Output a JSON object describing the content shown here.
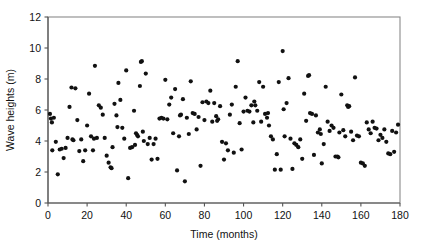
{
  "chart_data": {
    "type": "scatter",
    "title": "",
    "xlabel": "Time (months)",
    "ylabel": "Wave heights (m)",
    "xlim": [
      0,
      180
    ],
    "ylim": [
      0,
      12
    ],
    "xticks": [
      0,
      20,
      40,
      60,
      80,
      100,
      120,
      140,
      160,
      180
    ],
    "yticks": [
      0,
      2,
      4,
      6,
      8,
      10,
      12
    ],
    "xtick_labels": [
      "0",
      "20",
      "40",
      "60",
      "80",
      "100",
      "120",
      "140",
      "160",
      "180"
    ],
    "ytick_labels": [
      "0",
      "2",
      "4",
      "6",
      "8",
      "10",
      "12"
    ],
    "grid": false,
    "legend": null,
    "marker": {
      "shape": "circle",
      "color": "#111111",
      "size": 2.1
    },
    "frame_color": "#8a8a8a",
    "n_points": 186,
    "points": [
      [
        1.0,
        5.75
      ],
      [
        1.5,
        5.45
      ],
      [
        2.0,
        5.2
      ],
      [
        2.2,
        3.4
      ],
      [
        3.0,
        5.5
      ],
      [
        4.0,
        3.95
      ],
      [
        5.0,
        1.85
      ],
      [
        6.0,
        3.45
      ],
      [
        7.0,
        3.5
      ],
      [
        8.0,
        2.9
      ],
      [
        9.0,
        3.55
      ],
      [
        10.0,
        4.2
      ],
      [
        11.0,
        6.2
      ],
      [
        12.0,
        7.45
      ],
      [
        12.5,
        4.1
      ],
      [
        13.0,
        4.05
      ],
      [
        14.0,
        7.4
      ],
      [
        15.0,
        5.35
      ],
      [
        16.0,
        3.35
      ],
      [
        17.0,
        4.1
      ],
      [
        18.0,
        2.7
      ],
      [
        19.0,
        3.4
      ],
      [
        20.0,
        5.0
      ],
      [
        21.0,
        7.05
      ],
      [
        22.0,
        4.3
      ],
      [
        23.0,
        3.4
      ],
      [
        24.0,
        8.85
      ],
      [
        25.0,
        4.2
      ],
      [
        26.0,
        6.3
      ],
      [
        27.0,
        6.15
      ],
      [
        28.0,
        5.7
      ],
      [
        29.0,
        4.2
      ],
      [
        30.0,
        3.05
      ],
      [
        31.0,
        2.6
      ],
      [
        32.0,
        2.3
      ],
      [
        32.5,
        2.25
      ],
      [
        33.0,
        3.6
      ],
      [
        34.0,
        6.4
      ],
      [
        35.0,
        5.65
      ],
      [
        36.0,
        7.75
      ],
      [
        37.0,
        6.65
      ],
      [
        38.0,
        4.85
      ],
      [
        39.0,
        4.15
      ],
      [
        40.0,
        8.55
      ],
      [
        41.0,
        1.6
      ],
      [
        42.0,
        3.55
      ],
      [
        43.0,
        3.6
      ],
      [
        44.0,
        5.95
      ],
      [
        45.0,
        4.5
      ],
      [
        45.5,
        4.4
      ],
      [
        46.0,
        4.3
      ],
      [
        47.0,
        7.55
      ],
      [
        47.5,
        9.1
      ],
      [
        48.0,
        9.15
      ],
      [
        48.5,
        4.6
      ],
      [
        49.0,
        4.0
      ],
      [
        50.0,
        8.35
      ],
      [
        51.0,
        3.8
      ],
      [
        52.0,
        4.2
      ],
      [
        53.0,
        2.8
      ],
      [
        54.0,
        3.8
      ],
      [
        55.0,
        4.15
      ],
      [
        56.0,
        2.85
      ],
      [
        57.0,
        5.45
      ],
      [
        58.0,
        5.5
      ],
      [
        60.0,
        7.95
      ],
      [
        61.0,
        5.4
      ],
      [
        62.0,
        6.35
      ],
      [
        63.0,
        6.8
      ],
      [
        64.0,
        4.5
      ],
      [
        65.0,
        7.35
      ],
      [
        66.0,
        2.1
      ],
      [
        67.0,
        4.3
      ],
      [
        68.0,
        5.7
      ],
      [
        69.0,
        6.7
      ],
      [
        70.0,
        1.4
      ],
      [
        71.0,
        5.5
      ],
      [
        72.0,
        4.45
      ],
      [
        73.0,
        7.85
      ],
      [
        74.0,
        5.8
      ],
      [
        75.0,
        5.75
      ],
      [
        76.0,
        4.75
      ],
      [
        77.0,
        5.55
      ],
      [
        78.0,
        2.4
      ],
      [
        79.0,
        6.5
      ],
      [
        80.0,
        5.35
      ],
      [
        81.0,
        6.55
      ],
      [
        82.0,
        6.45
      ],
      [
        83.0,
        7.25
      ],
      [
        84.0,
        5.25
      ],
      [
        85.0,
        6.45
      ],
      [
        86.0,
        5.6
      ],
      [
        87.0,
        5.4
      ],
      [
        88.0,
        6.25
      ],
      [
        89.0,
        3.95
      ],
      [
        90.0,
        2.8
      ],
      [
        91.0,
        3.85
      ],
      [
        92.0,
        3.4
      ],
      [
        93.0,
        5.7
      ],
      [
        94.0,
        6.35
      ],
      [
        95.0,
        3.25
      ],
      [
        96.0,
        7.5
      ],
      [
        97.0,
        9.15
      ],
      [
        98.0,
        5.15
      ],
      [
        99.0,
        3.45
      ],
      [
        100.0,
        5.9
      ],
      [
        101.0,
        6.8
      ],
      [
        102.0,
        5.95
      ],
      [
        103.0,
        5.9
      ],
      [
        104.0,
        6.3
      ],
      [
        105.0,
        5.2
      ],
      [
        106.0,
        6.3
      ],
      [
        107.0,
        5.95
      ],
      [
        108.0,
        7.8
      ],
      [
        109.0,
        5.25
      ],
      [
        110.0,
        7.5
      ],
      [
        111.0,
        5.75
      ],
      [
        112.0,
        5.5
      ],
      [
        113.0,
        5.0
      ],
      [
        114.0,
        4.3
      ],
      [
        115.0,
        4.1
      ],
      [
        116.0,
        2.15
      ],
      [
        117.0,
        3.15
      ],
      [
        118.0,
        7.8
      ],
      [
        119.0,
        2.15
      ],
      [
        120.0,
        9.8
      ],
      [
        120.5,
        6.05
      ],
      [
        121.0,
        4.3
      ],
      [
        122.0,
        6.45
      ],
      [
        123.0,
        8.05
      ],
      [
        124.0,
        4.15
      ],
      [
        125.0,
        2.2
      ],
      [
        126.0,
        3.85
      ],
      [
        127.0,
        3.75
      ],
      [
        128.0,
        3.6
      ],
      [
        129.0,
        4.1
      ],
      [
        130.0,
        2.85
      ],
      [
        131.0,
        7.05
      ],
      [
        132.0,
        5.3
      ],
      [
        133.0,
        8.2
      ],
      [
        133.5,
        8.25
      ],
      [
        134.0,
        5.8
      ],
      [
        135.0,
        5.75
      ],
      [
        136.0,
        3.1
      ],
      [
        137.0,
        5.65
      ],
      [
        138.0,
        4.55
      ],
      [
        139.0,
        4.75
      ],
      [
        140.0,
        2.55
      ],
      [
        141.0,
        3.8
      ],
      [
        142.0,
        7.5
      ],
      [
        143.0,
        5.25
      ],
      [
        144.0,
        4.65
      ],
      [
        145.0,
        5.0
      ],
      [
        146.0,
        4.85
      ],
      [
        147.0,
        3.0
      ],
      [
        148.0,
        3.0
      ],
      [
        148.5,
        2.95
      ],
      [
        149.0,
        4.55
      ],
      [
        150.0,
        7.0
      ],
      [
        151.0,
        4.7
      ],
      [
        152.0,
        4.3
      ],
      [
        153.0,
        6.3
      ],
      [
        154.0,
        6.25
      ],
      [
        155.0,
        4.6
      ],
      [
        156.0,
        4.05
      ],
      [
        157.0,
        8.1
      ],
      [
        158.0,
        4.35
      ],
      [
        159.0,
        4.3
      ],
      [
        160.0,
        2.6
      ],
      [
        161.0,
        2.55
      ],
      [
        162.0,
        2.4
      ],
      [
        163.0,
        5.2
      ],
      [
        164.0,
        4.75
      ],
      [
        165.0,
        4.5
      ],
      [
        166.0,
        5.25
      ],
      [
        167.0,
        4.85
      ],
      [
        168.0,
        4.8
      ],
      [
        169.0,
        4.05
      ],
      [
        170.0,
        4.4
      ],
      [
        171.0,
        4.2
      ],
      [
        172.0,
        4.75
      ],
      [
        173.0,
        3.95
      ],
      [
        174.0,
        3.2
      ],
      [
        175.0,
        3.15
      ],
      [
        176.0,
        4.65
      ],
      [
        177.0,
        3.3
      ],
      [
        178.0,
        4.55
      ],
      [
        179.0,
        5.05
      ],
      [
        59.0,
        5.45
      ],
      [
        35.5,
        4.9
      ],
      [
        23.5,
        4.15
      ],
      [
        44.5,
        3.75
      ],
      [
        67.5,
        5.65
      ],
      [
        105.5,
        6.55
      ],
      [
        139.5,
        4.45
      ],
      [
        153.5,
        6.2
      ],
      [
        86.5,
        5.3
      ],
      [
        112.5,
        5.8
      ]
    ]
  }
}
